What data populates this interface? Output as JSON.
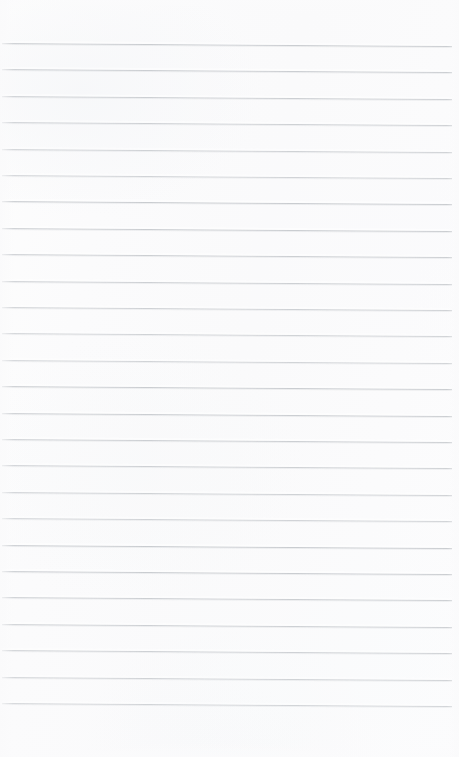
{
  "document": {
    "kind": "scanned-ruled-notebook-page",
    "title": "Blank ruled notebook page",
    "content_text": "",
    "has_handwriting": false,
    "has_printed_text": false,
    "page_width_px": 459,
    "page_height_px": 757
  },
  "paper": {
    "background_color": "#fbfbfc",
    "highlight_color": "#fdfdfd",
    "shadow_tint_color": "#f6f7f9",
    "edge_vignette_color": "#fafafb"
  },
  "ruling": {
    "line_color": "#c9ccd0",
    "line_thickness_px": 1,
    "line_count": 26,
    "first_line_y_px": 43,
    "last_line_y_px": 703,
    "line_spacing_px": 26.4,
    "line_left_x_px": 2,
    "line_right_x_px": 452,
    "right_margin_px": 7,
    "skew_drop_px": 3,
    "top_margin_px": 43,
    "bottom_margin_px": 54,
    "lines": [
      {
        "index": 1,
        "y": 43.0
      },
      {
        "index": 2,
        "y": 69.4
      },
      {
        "index": 3,
        "y": 95.8
      },
      {
        "index": 4,
        "y": 122.2
      },
      {
        "index": 5,
        "y": 148.6
      },
      {
        "index": 6,
        "y": 175.0
      },
      {
        "index": 7,
        "y": 201.4
      },
      {
        "index": 8,
        "y": 227.8
      },
      {
        "index": 9,
        "y": 254.2
      },
      {
        "index": 10,
        "y": 280.6
      },
      {
        "index": 11,
        "y": 307.0
      },
      {
        "index": 12,
        "y": 333.4
      },
      {
        "index": 13,
        "y": 359.8
      },
      {
        "index": 14,
        "y": 386.2
      },
      {
        "index": 15,
        "y": 412.6
      },
      {
        "index": 16,
        "y": 439.0
      },
      {
        "index": 17,
        "y": 465.4
      },
      {
        "index": 18,
        "y": 491.8
      },
      {
        "index": 19,
        "y": 518.2
      },
      {
        "index": 20,
        "y": 544.6
      },
      {
        "index": 21,
        "y": 571.0
      },
      {
        "index": 22,
        "y": 597.4
      },
      {
        "index": 23,
        "y": 623.8
      },
      {
        "index": 24,
        "y": 650.2
      },
      {
        "index": 25,
        "y": 676.6
      },
      {
        "index": 26,
        "y": 703.0
      }
    ]
  }
}
